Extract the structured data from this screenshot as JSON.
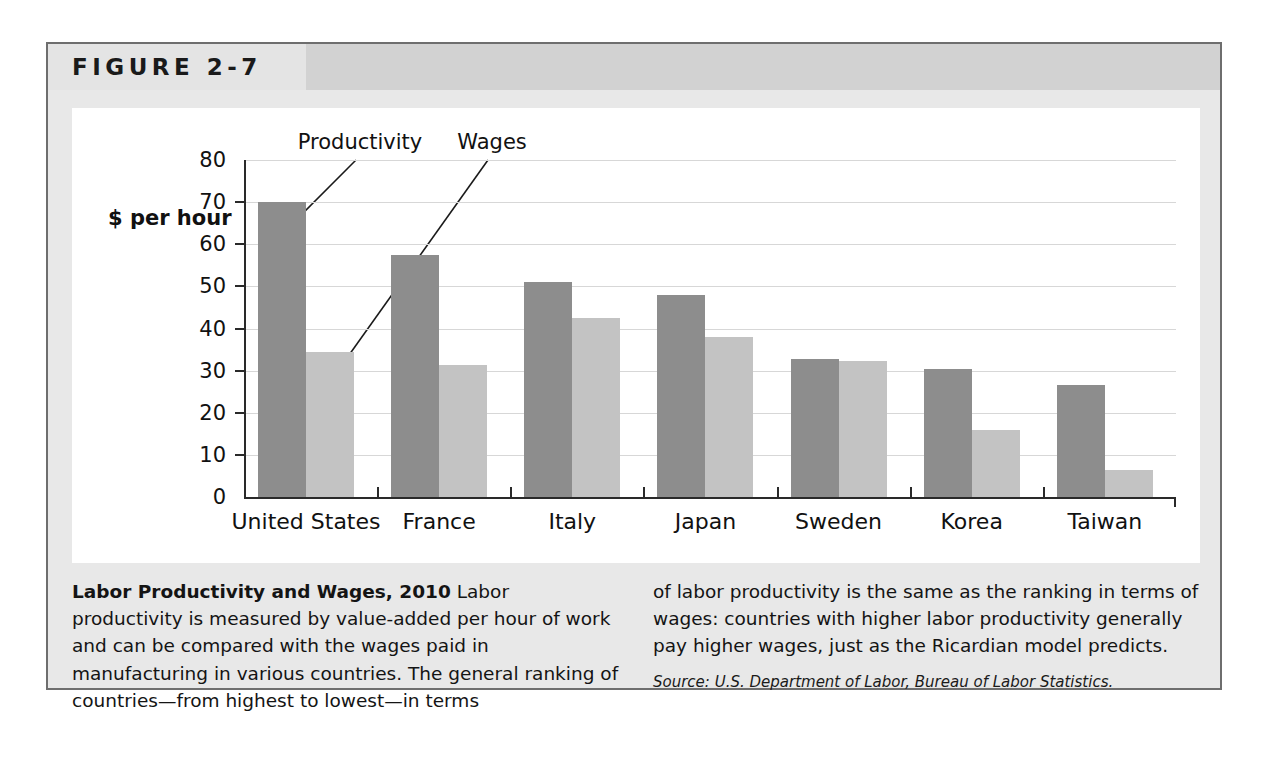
{
  "figure": {
    "number": "FIGURE 2-7"
  },
  "chart_data": {
    "type": "bar",
    "title": "",
    "xlabel": "",
    "ylabel": "$ per hour",
    "ylim": [
      0,
      80
    ],
    "yticks": [
      0,
      10,
      20,
      30,
      40,
      50,
      60,
      70,
      80
    ],
    "grid": true,
    "legend_position": "annotations-above-bars",
    "categories": [
      "United States",
      "France",
      "Italy",
      "Japan",
      "Sweden",
      "Korea",
      "Taiwan"
    ],
    "series": [
      {
        "name": "Productivity",
        "color": "#8d8d8d",
        "values": [
          70,
          57.5,
          51,
          48,
          32.8,
          30.5,
          26.5
        ]
      },
      {
        "name": "Wages",
        "color": "#c3c3c3",
        "values": [
          34.5,
          31.3,
          42.5,
          38,
          32.2,
          16,
          6.5
        ]
      }
    ],
    "annotations": [
      {
        "label": "Productivity",
        "points_to_series": "Productivity",
        "points_to_category": "United States"
      },
      {
        "label": "Wages",
        "points_to_series": "Wages",
        "points_to_category": "United States"
      }
    ]
  },
  "caption": {
    "title": "Labor Productivity and Wages, 2010",
    "body_left": " Labor productivity is measured by value-added per hour of work and can be compared with the wages paid in manufacturing in various countries. The general ranking of countries—from highest to lowest—in terms",
    "body_right": "of labor productivity is the same as the ranking in terms of wages: countries with higher labor productivity generally pay higher wages, just as the Ricardian model predicts.",
    "source": "Source: U.S. Department of Labor, Bureau of Labor Statistics."
  }
}
